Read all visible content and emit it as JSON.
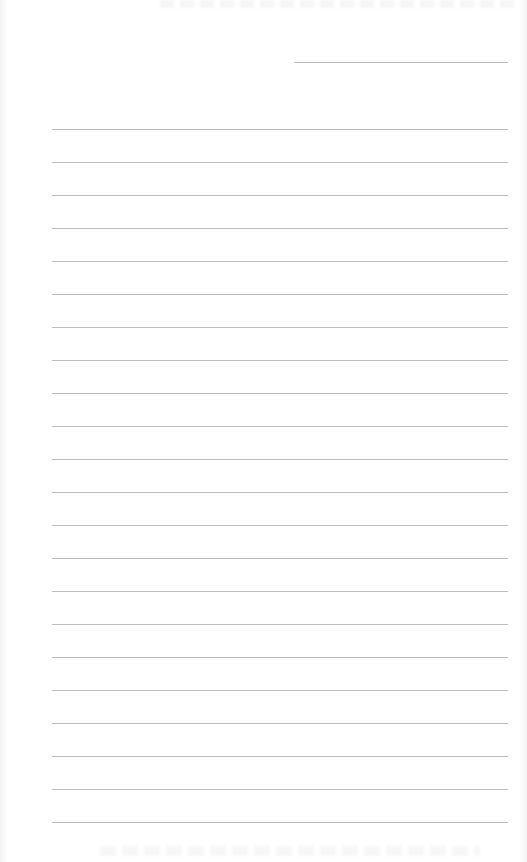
{
  "document": {
    "type": "lined-paper",
    "header_line": {
      "x": 294,
      "y": 62,
      "width": 214
    },
    "rules": {
      "count": 22,
      "first_y": 129,
      "spacing": 33,
      "left": 52,
      "width": 456
    },
    "colors": {
      "paper": "#ffffff",
      "rule": "#bdbdbd"
    }
  }
}
